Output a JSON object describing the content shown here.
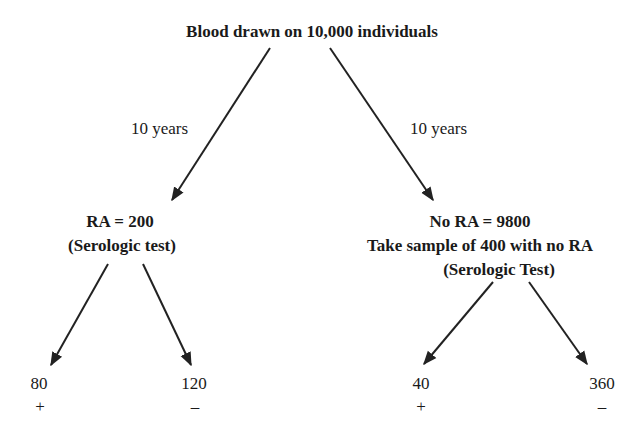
{
  "root": {
    "label": "Blood drawn on 10,000 individuals"
  },
  "edges": {
    "left_time": "10 years",
    "right_time": "10 years"
  },
  "left_node": {
    "line1": "RA = 200",
    "line2": "(Serologic test)"
  },
  "right_node": {
    "line1": "No RA = 9800",
    "line2": "Take sample of 400 with no RA",
    "line3": "(Serologic Test)"
  },
  "leaves": [
    {
      "value": "80",
      "sign": "+"
    },
    {
      "value": "120",
      "sign": "–"
    },
    {
      "value": "40",
      "sign": "+"
    },
    {
      "value": "360",
      "sign": "–"
    }
  ],
  "colors": {
    "line": "#222222",
    "text": "#1a1a1a",
    "background": "#ffffff"
  }
}
